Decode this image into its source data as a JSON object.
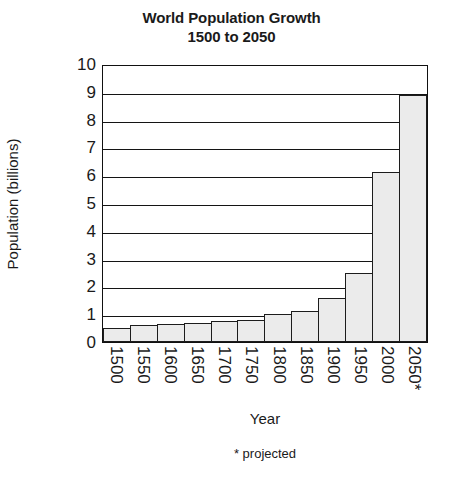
{
  "chart_data": {
    "type": "bar",
    "title": "World Population Growth",
    "subtitle": "1500 to 2050",
    "xlabel": "Year",
    "ylabel": "Population (billions)",
    "footnote": "* projected",
    "categories": [
      "1500",
      "1550",
      "1600",
      "1650",
      "1700",
      "1750",
      "1800",
      "1850",
      "1900",
      "1950",
      "2000",
      "2050*"
    ],
    "values": [
      0.5,
      0.6,
      0.65,
      0.7,
      0.75,
      0.8,
      1.0,
      1.1,
      1.6,
      2.5,
      6.1,
      8.9
    ],
    "ylim": [
      0,
      10
    ],
    "ytick_labels": [
      "10",
      "9",
      "8",
      "7",
      "6",
      "5",
      "4",
      "3",
      "2",
      "1",
      "0"
    ],
    "ytick_values": [
      10,
      9,
      8,
      7,
      6,
      5,
      4,
      3,
      2,
      1,
      0
    ],
    "grid": true,
    "legend": false,
    "bar_fill_color": "#ebebeb",
    "bar_border_color": "#1c1c1c",
    "axis_color": "#141414",
    "background_color": "#ffffff"
  }
}
